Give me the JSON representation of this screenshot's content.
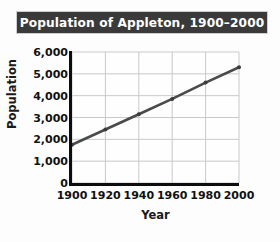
{
  "figure": {
    "title": "Population of Appleton, 1900–2000",
    "title_bar_color": "#3a3a3a",
    "title_text_color": "#ffffff",
    "background_color": "#fdfdfd"
  },
  "axes": {
    "ylabel": "Population",
    "xlabel": "Year",
    "yticks": [
      "0",
      "1,000",
      "2,000",
      "3,000",
      "4,000",
      "5,000",
      "6,000"
    ],
    "xticks": [
      "1900",
      "1920",
      "1940",
      "1960",
      "1980",
      "2000"
    ],
    "grid_color": "#c9c9c9",
    "spine_color": "#0d0d0d"
  },
  "chart_data": {
    "type": "line",
    "title": "Population of Appleton, 1900–2000",
    "xlabel": "Year",
    "ylabel": "Population",
    "x": [
      1900,
      1920,
      1940,
      1960,
      1980,
      2000
    ],
    "values": [
      1750,
      2450,
      3150,
      3850,
      4600,
      5300
    ],
    "series": [
      {
        "name": "Population of Appleton",
        "values": [
          1750,
          2450,
          3150,
          3850,
          4600,
          5300
        ]
      }
    ],
    "xlim": [
      1900,
      2000
    ],
    "ylim": [
      0,
      6000
    ],
    "ytick_values": [
      0,
      1000,
      2000,
      3000,
      4000,
      5000,
      6000
    ],
    "xtick_values": [
      1900,
      1920,
      1940,
      1960,
      1980,
      2000
    ],
    "grid": true,
    "legend": false,
    "line_color": "#4a4a4a",
    "marker": "dot",
    "marker_color": "#3c3c3c"
  }
}
